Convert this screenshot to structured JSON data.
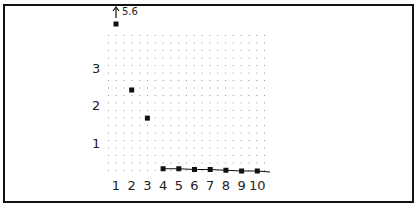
{
  "chart_data": {
    "type": "line",
    "title": "",
    "xlabel": "",
    "ylabel": "",
    "categories": [
      "1",
      "2",
      "3",
      "4",
      "5",
      "6",
      "7",
      "8",
      "9",
      "10"
    ],
    "x": [
      1,
      2,
      3,
      4,
      5,
      6,
      7,
      8,
      9,
      10
    ],
    "values": [
      5.6,
      2.4,
      1.65,
      0.3,
      0.3,
      0.28,
      0.28,
      0.26,
      0.24,
      0.24
    ],
    "ylim": [
      0,
      3.8
    ],
    "yticks": [
      1,
      2,
      3
    ],
    "grid": "dotted",
    "legend": null,
    "annotations": [
      {
        "x": 1,
        "text": "5.6",
        "note": "off-scale arrow marker"
      }
    ],
    "line_segment_from_x": 4
  },
  "colors": {
    "ink": "#111111",
    "grid": "#9a9a9a",
    "background": "#ffffff"
  }
}
